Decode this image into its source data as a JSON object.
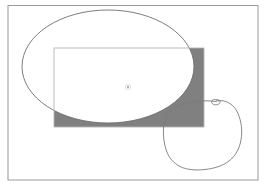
{
  "figure": {
    "title": "Region bounded by a rectangle and an ellipse with an adjacent closed curve",
    "canvas": {
      "width": 267,
      "height": 187,
      "background_color": "#ffffff"
    },
    "frame": {
      "name": "outer-border-frame",
      "x": 8,
      "y": 5.5,
      "width": 250,
      "height": 174.5,
      "stroke_color": "#9a9a9a",
      "stroke_width": 1,
      "fill_color": "#ffffff"
    },
    "ellipse": {
      "name": "ellipse-outline",
      "center_x": 108,
      "center_y": 66.5,
      "radius_x": 86,
      "radius_y": 56.5,
      "stroke_color": "#6e6e6e",
      "stroke_width": 0.9,
      "fill_color": "#ffffff"
    },
    "rectangle": {
      "name": "rectangle-outline",
      "x": 54,
      "y": 48,
      "width": 150,
      "height": 79,
      "stroke_color": "#b4b4b4",
      "stroke_width": 0.9,
      "fill_color": "none"
    },
    "shaded_region": {
      "name": "shaded-difference-region",
      "description": "Portion of the rectangle lying outside the ellipse",
      "fill_color": "#808080",
      "stroke_color": "#6e6e6e",
      "stroke_width": 0.6,
      "operation": "rectangle minus ellipse"
    },
    "center_mark": {
      "name": "center-point-marker",
      "x": 128,
      "y": 87,
      "radius": 0.9,
      "fill_color": "#8c8c8c",
      "halo_radius": 2.6,
      "halo_color": "#cfcfcf"
    },
    "blob": {
      "name": "freehand-closed-curve",
      "stroke_color": "#7a7a7a",
      "stroke_width": 0.9,
      "fill_color": "none",
      "bounds": {
        "x_min": 163,
        "y_min": 99,
        "x_max": 242,
        "y_max": 170
      },
      "path": "M 216.5 101.5 C 208 100.5 199 100.5 191 102 C 183 103.5 175 106.5 170.5 111 C 166 115.5 164 121 163.5 128 C 163 136 164 144 166.5 151 C 169 158 173.5 163 180 166.5 C 187 170 196 170.5 205 169.5 C 214 168.5 222.5 166 229 161 C 235.5 156 239.5 148.5 241 140 C 242.5 131 241.5 121.5 238 113.5 C 235 106.5 230 102.5 224 101 C 222 100.5 220 100.5 218.5 100.7",
      "loop": {
        "name": "curve-loop-cusp",
        "description": "Small loop where the freehand curve crosses itself near the top",
        "path": "M 218.5 100.8 C 215.5 99 212.5 99.2 211.8 101 C 211 103 213 104.8 215.8 104.8 C 218.6 104.8 220.6 103.2 220 101.4 C 219.6 100.2 218 99.6 216.4 99.8"
      }
    }
  }
}
